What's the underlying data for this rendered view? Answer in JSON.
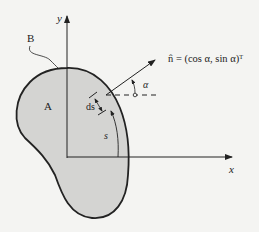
{
  "labels": {
    "y_axis": "y",
    "x_axis": "x",
    "boundary": "B",
    "region": "A",
    "ds": "ds",
    "s": "s",
    "alpha": "α",
    "normal": "n̂ = (cos α, sin α)ᵀ"
  },
  "colors": {
    "region_fill": "#d4d4d2",
    "stroke": "#222222",
    "background": "#f4f4f2"
  }
}
